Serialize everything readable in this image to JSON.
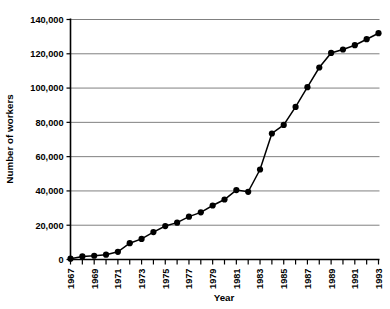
{
  "chart_data": {
    "type": "line",
    "title": "",
    "xlabel": "Year",
    "ylabel": "Number of workers",
    "xlim": [
      1967,
      1993
    ],
    "ylim": [
      0,
      140000
    ],
    "grid": true,
    "legend": null,
    "y_ticks": [
      0,
      20000,
      40000,
      60000,
      80000,
      100000,
      120000,
      140000
    ],
    "y_tick_labels": [
      "0",
      "20,000",
      "40,000",
      "60,000",
      "80,000",
      "100,000",
      "120,000",
      "140,000"
    ],
    "x_ticks": [
      1967,
      1968,
      1969,
      1970,
      1971,
      1972,
      1973,
      1974,
      1975,
      1976,
      1977,
      1978,
      1979,
      1980,
      1981,
      1982,
      1983,
      1984,
      1985,
      1986,
      1987,
      1988,
      1989,
      1990,
      1991,
      1992,
      1993
    ],
    "x_tick_labels": [
      "1967",
      "",
      "1969",
      "",
      "1971",
      "",
      "1973",
      "",
      "1975",
      "",
      "1977",
      "",
      "1979",
      "",
      "1981",
      "",
      "1983",
      "",
      "1985",
      "",
      "1987",
      "",
      "1989",
      "",
      "1991",
      "",
      "1993"
    ],
    "x": [
      1967,
      1968,
      1969,
      1970,
      1971,
      1972,
      1973,
      1974,
      1975,
      1976,
      1977,
      1978,
      1979,
      1980,
      1981,
      1982,
      1983,
      1984,
      1985,
      1986,
      1987,
      1988,
      1989,
      1990,
      1991,
      1992,
      1993
    ],
    "values": [
      500,
      1800,
      2200,
      2800,
      4500,
      9500,
      12000,
      16000,
      19500,
      21500,
      25000,
      27500,
      31500,
      35000,
      40500,
      39500,
      52500,
      73500,
      78500,
      89000,
      100500,
      112000,
      120500,
      122500,
      125000,
      128500,
      132000
    ],
    "series": [
      {
        "name": "Number of workers",
        "marker": "circle",
        "color": "#000000",
        "values": [
          500,
          1800,
          2200,
          2800,
          4500,
          9500,
          12000,
          16000,
          19500,
          21500,
          25000,
          27500,
          31500,
          35000,
          40500,
          39500,
          52500,
          73500,
          78500,
          89000,
          100500,
          112000,
          120500,
          122500,
          125000,
          128500,
          132000
        ]
      }
    ]
  },
  "style": {
    "line_color": "#000000",
    "marker_color": "#000000",
    "grid_color": "#808080",
    "axis_color": "#000000",
    "background": "#ffffff"
  }
}
